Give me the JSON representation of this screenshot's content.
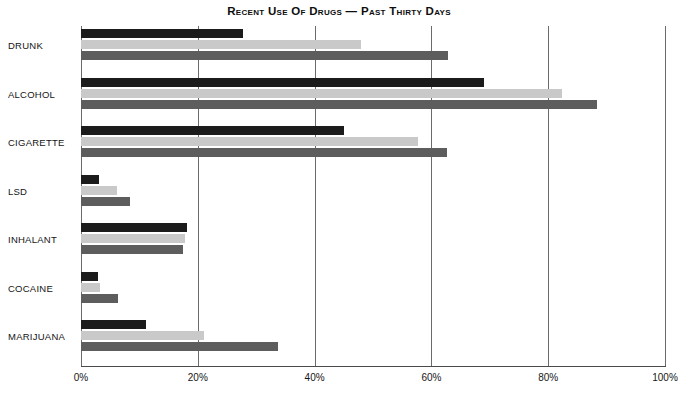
{
  "chart_data": {
    "type": "bar",
    "orientation": "horizontal",
    "title": "Recent Use Of Drugs — Past Thirty Days",
    "xlabel": "",
    "ylabel": "",
    "xlim": [
      0,
      100
    ],
    "xticks": [
      0,
      20,
      40,
      60,
      80,
      100
    ],
    "xtick_labels": [
      "0%",
      "20%",
      "40%",
      "60%",
      "80%",
      "100%"
    ],
    "grid": "vertical",
    "legend": "none",
    "categories": [
      "DRUNK",
      "ALCOHOL",
      "CIGARETTE",
      "LSD",
      "INHALANT",
      "COCAINE",
      "MARIJUANA"
    ],
    "series": [
      {
        "name": "series-1",
        "color": "#1b1b1b",
        "values": [
          27.7,
          69.0,
          45.0,
          3.0,
          18.2,
          2.9,
          11.2
        ]
      },
      {
        "name": "series-2",
        "color": "#c9c9c9",
        "values": [
          48.0,
          82.3,
          57.7,
          6.2,
          17.8,
          3.3,
          21.0
        ]
      },
      {
        "name": "series-3",
        "color": "#5d5d5d",
        "values": [
          62.8,
          88.4,
          62.7,
          8.4,
          17.5,
          6.3,
          33.7
        ]
      }
    ]
  },
  "colors": {
    "series_1": "#1b1b1b",
    "series_2": "#c9c9c9",
    "series_3": "#5d5d5d",
    "gridline": "#6b6b6b",
    "axis": "#4a4a4a",
    "background": "#ffffff",
    "text": "#141414"
  }
}
